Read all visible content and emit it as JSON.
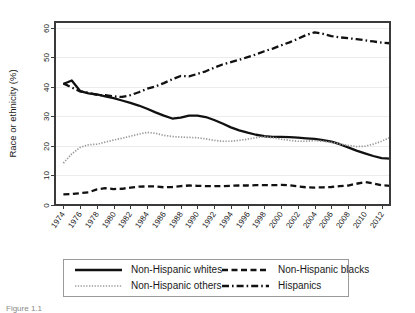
{
  "figure": {
    "caption_partial": "Figure 1.1"
  },
  "chart_data": {
    "type": "line",
    "title": "",
    "subtitle": "",
    "xlabel": "",
    "ylabel": "Race or ethnicity (%)",
    "xlim": [
      1973,
      2013
    ],
    "ylim": [
      0,
      62
    ],
    "ytick_values": [
      0,
      10,
      20,
      30,
      40,
      50,
      60
    ],
    "ytick_labels": [
      "0",
      "10",
      "20",
      "30",
      "40",
      "50",
      "60"
    ],
    "xtick_values": [
      1974,
      1976,
      1978,
      1980,
      1982,
      1984,
      1986,
      1988,
      1990,
      1992,
      1994,
      1996,
      1998,
      2000,
      2002,
      2004,
      2006,
      2008,
      2010,
      2012
    ],
    "xtick_labels": [
      "1974",
      "1976",
      "1978",
      "1980",
      "1982",
      "1984",
      "1986",
      "1988",
      "1990",
      "1992",
      "1994",
      "1996",
      "1998",
      "2000",
      "2002",
      "2004",
      "2006",
      "2008",
      "2010",
      "2012"
    ],
    "grid": true,
    "grid_axis": "y",
    "legend_position": "below-plot",
    "x": [
      1974,
      1975,
      1976,
      1977,
      1978,
      1979,
      1980,
      1981,
      1982,
      1983,
      1984,
      1985,
      1986,
      1987,
      1988,
      1989,
      1990,
      1991,
      1992,
      1993,
      1994,
      1995,
      1996,
      1997,
      1998,
      1999,
      2000,
      2001,
      2002,
      2003,
      2004,
      2005,
      2006,
      2007,
      2008,
      2009,
      2010,
      2011,
      2012,
      2013
    ],
    "series": [
      {
        "name": "Non-Hispanic whites",
        "style": "solid",
        "color": "#111111",
        "values": [
          41.0,
          42.2,
          38.6,
          37.8,
          37.5,
          36.8,
          36.2,
          35.4,
          34.6,
          33.7,
          32.6,
          31.4,
          30.3,
          29.3,
          29.6,
          30.3,
          30.3,
          29.8,
          28.8,
          27.6,
          26.3,
          25.3,
          24.5,
          23.8,
          23.3,
          23.1,
          23.1,
          23.0,
          22.8,
          22.6,
          22.4,
          22.0,
          21.5,
          20.6,
          19.5,
          18.4,
          17.5,
          16.6,
          15.9,
          15.7
        ]
      },
      {
        "name": "Non-Hispanic others",
        "style": "dotted",
        "color": "#9a9a9a",
        "values": [
          14.2,
          17.3,
          19.5,
          20.4,
          20.6,
          21.3,
          22.0,
          22.6,
          23.3,
          24.0,
          24.6,
          24.3,
          23.6,
          23.2,
          23.0,
          22.9,
          22.8,
          22.4,
          21.9,
          21.6,
          21.6,
          21.9,
          22.3,
          22.8,
          23.1,
          22.8,
          22.3,
          21.9,
          21.6,
          21.6,
          21.8,
          21.6,
          21.2,
          20.7,
          20.2,
          19.8,
          19.9,
          20.6,
          21.6,
          22.9
        ]
      },
      {
        "name": "Non-Hispanic blacks",
        "style": "dashed",
        "color": "#111111",
        "values": [
          3.6,
          3.7,
          4.0,
          4.3,
          5.3,
          5.7,
          5.4,
          5.5,
          5.9,
          6.2,
          6.3,
          6.3,
          6.0,
          6.1,
          6.4,
          6.6,
          6.5,
          6.4,
          6.4,
          6.4,
          6.5,
          6.6,
          6.6,
          6.7,
          6.7,
          6.7,
          6.8,
          6.7,
          6.3,
          6.0,
          5.9,
          6.0,
          6.1,
          6.4,
          6.6,
          7.2,
          7.8,
          7.3,
          6.7,
          6.5
        ]
      },
      {
        "name": "Hispanics",
        "style": "dashdot",
        "color": "#111111",
        "values": [
          41.2,
          39.8,
          38.5,
          38.0,
          37.3,
          37.2,
          36.8,
          36.6,
          37.2,
          38.2,
          39.4,
          40.2,
          41.3,
          42.6,
          43.7,
          43.6,
          44.4,
          45.3,
          46.5,
          47.6,
          48.4,
          49.2,
          50.1,
          51.0,
          52.1,
          53.0,
          54.1,
          55.1,
          56.3,
          57.6,
          58.5,
          58.0,
          57.2,
          56.8,
          56.5,
          56.2,
          55.8,
          55.4,
          55.0,
          54.8
        ]
      }
    ]
  },
  "legend": {
    "entries": [
      {
        "label": "Non-Hispanic whites",
        "style": "solid"
      },
      {
        "label": "Non-Hispanic blacks",
        "style": "dashed"
      },
      {
        "label": "Non-Hispanic others",
        "style": "dotted"
      },
      {
        "label": "Hispanics",
        "style": "dashdot"
      }
    ]
  }
}
